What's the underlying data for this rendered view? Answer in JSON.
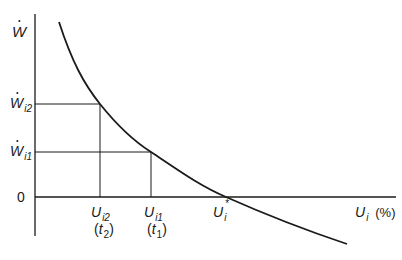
{
  "diagram": {
    "colors": {
      "line": "#1a1a1a",
      "background": "#ffffff"
    },
    "y_axis": {
      "label_main": "W",
      "label_dot": true
    },
    "x_axis": {
      "label_main": "U",
      "label_sub": "i",
      "label_unit": "(%)"
    },
    "y_ticks": [
      {
        "main": "W",
        "sub": "i2",
        "dot": true
      },
      {
        "main": "W",
        "sub": "i1",
        "dot": true
      },
      {
        "main": "0"
      }
    ],
    "x_ticks": [
      {
        "main": "U",
        "sub": "i2",
        "time": "t",
        "time_sub": "2"
      },
      {
        "main": "U",
        "sub": "i1",
        "time": "t",
        "time_sub": "1"
      },
      {
        "main": "U",
        "sub": "i",
        "star": "*"
      }
    ],
    "curve": {
      "description": "Downward-sloping convex curve (Phillips curve) crossing zero at U_i*",
      "points": [
        [
          59,
          22
        ],
        [
          80,
          70
        ],
        [
          100,
          104
        ],
        [
          125,
          130
        ],
        [
          151,
          152
        ],
        [
          190,
          177
        ],
        [
          226,
          197
        ],
        [
          280,
          222
        ],
        [
          347,
          244
        ]
      ]
    },
    "guides": [
      {
        "type": "horizontal",
        "from": "W_i2",
        "to": "U_i2"
      },
      {
        "type": "horizontal",
        "from": "W_i1",
        "to": "U_i1"
      }
    ]
  }
}
